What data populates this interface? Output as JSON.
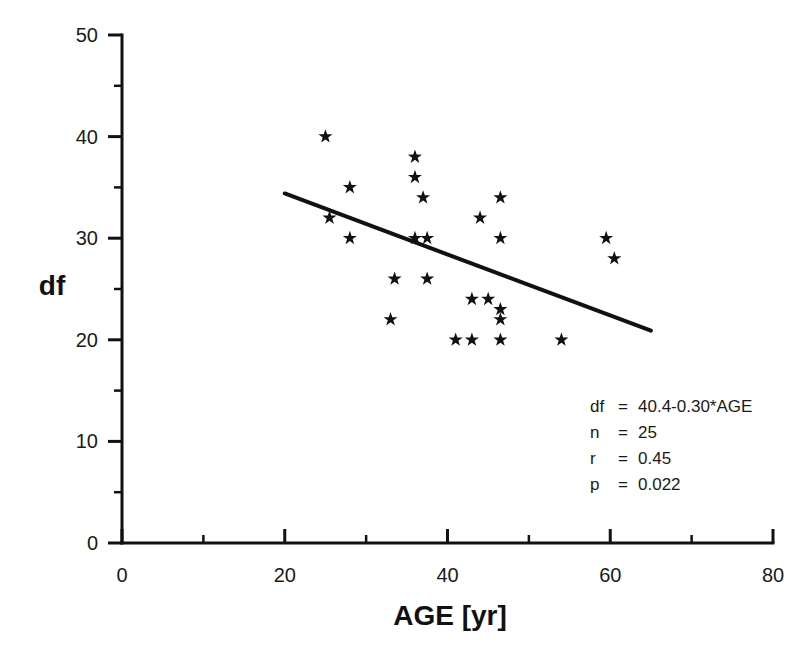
{
  "chart_data": {
    "type": "scatter",
    "title": "",
    "xlabel": "AGE   [yr]",
    "ylabel": "df",
    "xlim": [
      0,
      80
    ],
    "ylim": [
      0,
      50
    ],
    "x_ticks": [
      0,
      20,
      40,
      60,
      80
    ],
    "x_tick_labels": [
      "0",
      "20",
      "40",
      "60",
      "80"
    ],
    "x_minor_ticks": [
      10,
      30,
      50,
      70
    ],
    "y_ticks": [
      0,
      10,
      20,
      30,
      40,
      50
    ],
    "y_tick_labels": [
      "0",
      "10",
      "20",
      "30",
      "40",
      "50"
    ],
    "y_minor_ticks": [
      5,
      15,
      25,
      35,
      45
    ],
    "grid": false,
    "legend": "none",
    "marker": "star",
    "marker_color": "#111111",
    "points": [
      {
        "x": 25.0,
        "y": 40
      },
      {
        "x": 25.5,
        "y": 32
      },
      {
        "x": 28.0,
        "y": 35
      },
      {
        "x": 28.0,
        "y": 30
      },
      {
        "x": 33.0,
        "y": 22
      },
      {
        "x": 33.5,
        "y": 26
      },
      {
        "x": 36.0,
        "y": 38
      },
      {
        "x": 36.0,
        "y": 36
      },
      {
        "x": 36.0,
        "y": 30
      },
      {
        "x": 37.0,
        "y": 34
      },
      {
        "x": 37.5,
        "y": 30
      },
      {
        "x": 37.5,
        "y": 26
      },
      {
        "x": 41.0,
        "y": 20
      },
      {
        "x": 43.0,
        "y": 24
      },
      {
        "x": 43.0,
        "y": 20
      },
      {
        "x": 44.0,
        "y": 32
      },
      {
        "x": 45.0,
        "y": 24
      },
      {
        "x": 46.5,
        "y": 34
      },
      {
        "x": 46.5,
        "y": 30
      },
      {
        "x": 46.5,
        "y": 23
      },
      {
        "x": 46.5,
        "y": 22
      },
      {
        "x": 46.5,
        "y": 20
      },
      {
        "x": 54.0,
        "y": 20
      },
      {
        "x": 59.5,
        "y": 30
      },
      {
        "x": 60.5,
        "y": 28
      }
    ],
    "fit_line": {
      "equation": "df = 40.4-0.30*AGE",
      "intercept": 40.4,
      "slope": -0.3,
      "x_start": 20,
      "x_end": 65,
      "y_start": 34.4,
      "y_end": 20.9,
      "color": "#111111"
    },
    "annotations": [
      {
        "label": "df",
        "operator": "=",
        "value": "40.4-0.30*AGE"
      },
      {
        "label": "n",
        "operator": "=",
        "value": "25"
      },
      {
        "label": "r",
        "operator": "=",
        "value": "0.45"
      },
      {
        "label": "p",
        "operator": "=",
        "value": "0.022"
      }
    ]
  }
}
